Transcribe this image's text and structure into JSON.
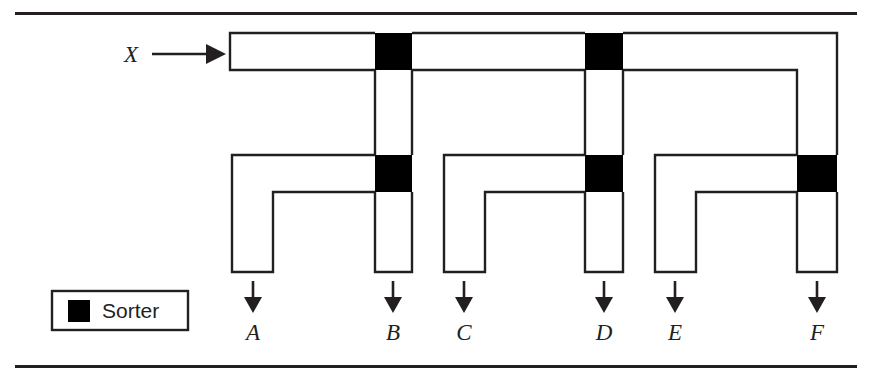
{
  "figure": {
    "background_color": "#ffffff",
    "ink_color": "#231f20",
    "sorter_color": "#000000"
  },
  "rules": {
    "top": {
      "x1": 15,
      "x2": 857,
      "y": 12,
      "thickness": 3
    },
    "bottom": {
      "x1": 15,
      "x2": 857,
      "y": 365,
      "thickness": 3
    }
  },
  "inlet": {
    "label": "X",
    "label_x": 131,
    "label_y": 62,
    "arrow": {
      "x1": 152,
      "x2": 224,
      "y": 54
    }
  },
  "legend": {
    "box": {
      "x": 52,
      "y": 291,
      "width": 136,
      "height": 39
    },
    "swatch": {
      "x": 68,
      "y": 300,
      "size": 22
    },
    "label": "Sorter",
    "label_x": 102,
    "label_y": 311
  },
  "geometry": {
    "top_duct": {
      "top_y": 33,
      "bottom_y": 70,
      "left_x": 230
    },
    "drop_top_y": 70,
    "branch_bar_top_y": 155,
    "branch_bar_bottom_y": 192,
    "leg_bottom_y": 272,
    "sorter_height": 37
  },
  "sorters": [
    {
      "id": "sorter-top-b",
      "x": 375,
      "y": 33,
      "width": 37,
      "height": 37,
      "row": "top"
    },
    {
      "id": "sorter-top-d",
      "x": 585,
      "y": 33,
      "width": 38,
      "height": 37,
      "row": "top"
    },
    {
      "id": "sorter-mid-b",
      "x": 375,
      "y": 155,
      "width": 37,
      "height": 37,
      "row": "middle"
    },
    {
      "id": "sorter-mid-d",
      "x": 585,
      "y": 155,
      "width": 38,
      "height": 37,
      "row": "middle"
    },
    {
      "id": "sorter-mid-f",
      "x": 797,
      "y": 155,
      "width": 40,
      "height": 37,
      "row": "middle"
    }
  ],
  "branches": [
    {
      "id": "branch-ab",
      "left_leg_x": 232,
      "left_leg_right_x": 273,
      "right_leg_x": 375,
      "right_leg_right_x": 412,
      "outlets": [
        "A",
        "B"
      ]
    },
    {
      "id": "branch-cd",
      "left_leg_x": 444,
      "left_leg_right_x": 485,
      "right_leg_x": 585,
      "right_leg_right_x": 623,
      "outlets": [
        "C",
        "D"
      ]
    },
    {
      "id": "branch-ef",
      "left_leg_x": 655,
      "left_leg_right_x": 696,
      "right_leg_x": 797,
      "right_leg_right_x": 837,
      "outlets": [
        "E",
        "F"
      ]
    }
  ],
  "outlets": [
    {
      "label": "A",
      "center_x": 253,
      "arrow_y1": 281,
      "arrow_y2": 312,
      "label_y": 340
    },
    {
      "label": "B",
      "center_x": 393,
      "arrow_y1": 281,
      "arrow_y2": 312,
      "label_y": 340
    },
    {
      "label": "C",
      "center_x": 464,
      "arrow_y1": 281,
      "arrow_y2": 312,
      "label_y": 340
    },
    {
      "label": "D",
      "center_x": 604,
      "arrow_y1": 281,
      "arrow_y2": 312,
      "label_y": 340
    },
    {
      "label": "E",
      "center_x": 675,
      "arrow_y1": 281,
      "arrow_y2": 312,
      "label_y": 340
    },
    {
      "label": "F",
      "center_x": 817,
      "arrow_y1": 281,
      "arrow_y2": 312,
      "label_y": 340
    }
  ]
}
